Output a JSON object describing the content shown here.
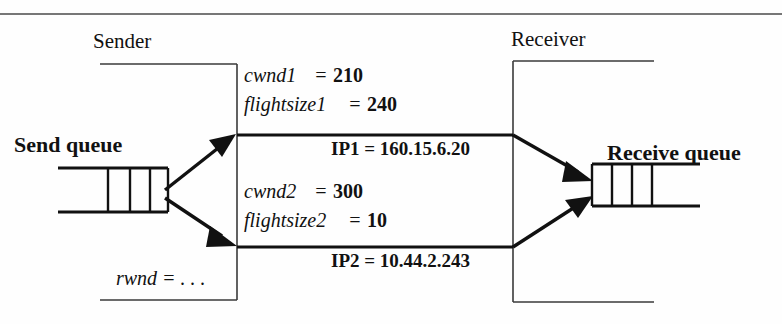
{
  "diagram": {
    "title_sender": "Sender",
    "title_receiver": "Receiver",
    "send_queue_label": "Send queue",
    "receive_queue_label": "Receive queue",
    "sender_params": {
      "rwnd_label": "rwnd = . . ."
    },
    "paths": [
      {
        "id": "path1",
        "cwnd_var": "cwnd1",
        "cwnd_eq": "=",
        "cwnd_value": "210",
        "flightsize_var": "flightsize1",
        "flightsize_eq": "=",
        "flightsize_value": "240",
        "ip_label": "IP1 = 160.15.6.20"
      },
      {
        "id": "path2",
        "cwnd_var": "cwnd2",
        "cwnd_eq": "=",
        "cwnd_value": "300",
        "flightsize_var": "flightsize2",
        "flightsize_eq": "=",
        "flightsize_value": "10",
        "ip_label": "IP2 = 10.44.2.243"
      }
    ],
    "colors": {
      "ink": "#111111",
      "frame": "#4a4a4a",
      "background": "#fefefe"
    }
  }
}
